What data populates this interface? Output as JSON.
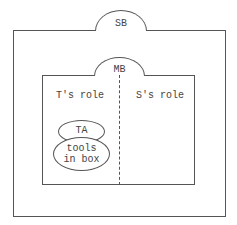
{
  "diagram": {
    "outer_box": {
      "tab_label": "SB"
    },
    "inner_box": {
      "tab_label": "MB",
      "left_region": {
        "label": "T's role"
      },
      "right_region": {
        "label": "S's role"
      },
      "divider": "dashed"
    },
    "ellipses": [
      {
        "label": "TA"
      },
      {
        "label_line1": "tools",
        "label_line2": "in box"
      }
    ]
  }
}
